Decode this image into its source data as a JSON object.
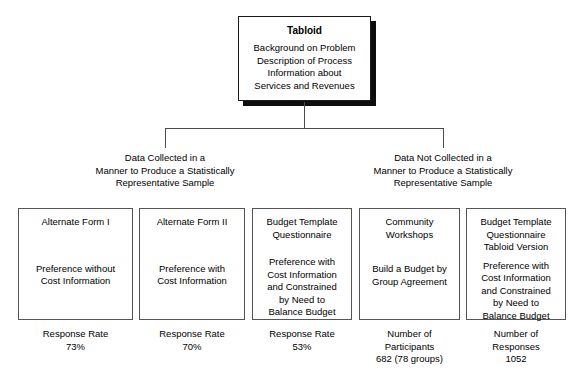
{
  "figure": {
    "root": {
      "title": "Tabloid",
      "lines": [
        "Background on Problem",
        "Description of Process",
        "Information about",
        "Services and Revenues"
      ]
    },
    "groups": [
      {
        "name": "data-collected-representative",
        "lines": [
          "Data Collected in a",
          "Manner to Produce a Statistically",
          "Representative Sample"
        ]
      },
      {
        "name": "data-not-collected-representative",
        "lines": [
          "Data Not Collected in a",
          "Manner to Produce a Statistically",
          "Representative Sample"
        ]
      }
    ],
    "leaves": [
      {
        "name": "alternate-form-i",
        "title": [
          "Alternate Form I"
        ],
        "body": [
          "Preference without",
          "Cost Information"
        ],
        "caption": [
          "Response Rate",
          "73%"
        ]
      },
      {
        "name": "alternate-form-ii",
        "title": [
          "Alternate Form II"
        ],
        "body": [
          "Preference with",
          "Cost Information"
        ],
        "caption": [
          "Response Rate",
          "70%"
        ]
      },
      {
        "name": "budget-template-questionnaire",
        "title": [
          "Budget Template",
          "Questionnaire"
        ],
        "body": [
          "Preference with",
          "Cost Information",
          "and Constrained",
          "by Need to",
          "Balance Budget"
        ],
        "caption": [
          "Response Rate",
          "53%"
        ]
      },
      {
        "name": "community-workshops",
        "title": [
          "Community",
          "Workshops"
        ],
        "body": [
          "Build a Budget by",
          "Group Agreement"
        ],
        "caption": [
          "Number of",
          "Participants",
          "682 (78 groups)"
        ]
      },
      {
        "name": "budget-template-questionnaire-tabloid-version",
        "title": [
          "Budget Template",
          "Questionnaire",
          "Tabloid Version"
        ],
        "body": [
          "Preference with",
          "Cost Information",
          "and Constrained",
          "by Need to",
          "Balance Budget"
        ],
        "caption": [
          "Number of",
          "Responses",
          "1052"
        ]
      }
    ],
    "colors": {
      "background": "#ffffff",
      "text": "#000000",
      "box_border": "#555555",
      "root_border": "#1a1a1a",
      "root_shadow": "#0d0d0d",
      "connector": "#4a4a4a"
    }
  }
}
